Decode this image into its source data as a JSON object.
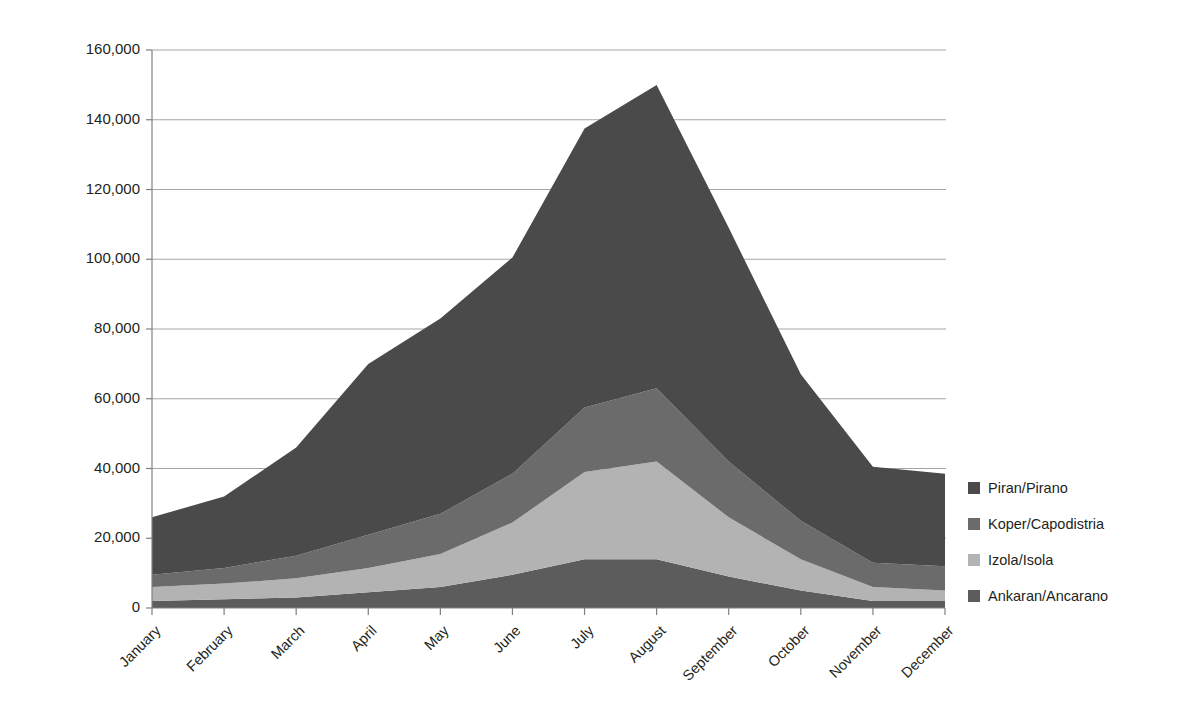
{
  "chart_data": {
    "type": "area",
    "stacked": true,
    "title": "",
    "xlabel": "",
    "ylabel": "Number of tourist arrivals per municipality, monthly, 2018",
    "categories": [
      "January",
      "February",
      "March",
      "April",
      "May",
      "June",
      "July",
      "August",
      "September",
      "October",
      "November",
      "December"
    ],
    "ylim": [
      0,
      160000
    ],
    "ytick_labels": [
      "0",
      "20,000",
      "40,000",
      "60,000",
      "80,000",
      "100,000",
      "120,000",
      "140,000",
      "160,000"
    ],
    "ytick_values": [
      0,
      20000,
      40000,
      60000,
      80000,
      100000,
      120000,
      140000,
      160000
    ],
    "grid": true,
    "legend_position": "right",
    "stack_order_bottom_to_top": [
      "Ankaran/Ancarano",
      "Izola/Isola",
      "Koper/Capodistria",
      "Piran/Pirano"
    ],
    "series": [
      {
        "name": "Piran/Pirano",
        "color": "#4a4a4a",
        "values": [
          16500,
          20500,
          31000,
          49000,
          56000,
          62000,
          80000,
          87000,
          67000,
          42000,
          27500,
          26500
        ]
      },
      {
        "name": "Koper/Capodistria",
        "color": "#6b6b6b",
        "values": [
          3500,
          4500,
          6500,
          9500,
          11500,
          14000,
          18500,
          21000,
          16000,
          11000,
          7000,
          7000
        ]
      },
      {
        "name": "Izola/Isola",
        "color": "#b3b3b3",
        "values": [
          4000,
          4500,
          5500,
          7000,
          9500,
          15000,
          25000,
          28000,
          17000,
          9000,
          4000,
          3000
        ]
      },
      {
        "name": "Ankaran/Ancarano",
        "color": "#5c5c5c",
        "values": [
          2000,
          2500,
          3000,
          4500,
          6000,
          9500,
          14000,
          14000,
          9000,
          5000,
          2000,
          2000
        ]
      }
    ],
    "totals": [
      26000,
      32000,
      46000,
      70000,
      83000,
      100500,
      137500,
      150000,
      109000,
      67000,
      40500,
      38500
    ]
  },
  "legend": {
    "items": [
      {
        "label": "Piran/Pirano",
        "color": "#4a4a4a"
      },
      {
        "label": "Koper/Capodistria",
        "color": "#6b6b6b"
      },
      {
        "label": "Izola/Isola",
        "color": "#b3b3b3"
      },
      {
        "label": "Ankaran/Ancarano",
        "color": "#5c5c5c"
      }
    ]
  },
  "colors": {
    "grid": "#a6a6a6",
    "axis": "#808080",
    "text": "#231f20",
    "background": "#ffffff"
  }
}
